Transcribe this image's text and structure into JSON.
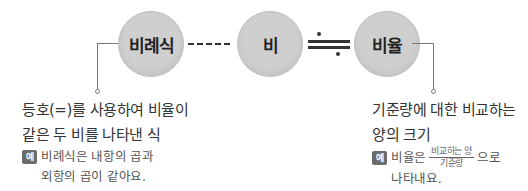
{
  "nodes": [
    {
      "id": "proportion-expression",
      "label": "비례식"
    },
    {
      "id": "ratio",
      "label": "비"
    },
    {
      "id": "rate",
      "label": "비율"
    }
  ],
  "connectors": {
    "ratio_to_expression": "dashed-line",
    "ratio_to_rate": "approximately-equal-sign"
  },
  "left_note": {
    "definition_line1": "등호(=)를 사용하여 비율이",
    "definition_line2": "같은 두 비를 나타낸 식",
    "example_badge": "예",
    "example_line1": "비례식은 내항의 곱과",
    "example_line2": "외항의 곱이 같아요."
  },
  "right_note": {
    "definition_line1": "기준량에 대한 비교하는",
    "definition_line2": "양의 크기",
    "example_badge": "예",
    "example_prefix": "비율은",
    "fraction_numerator": "비교하는 양",
    "fraction_denominator": "기준량",
    "example_suffix": "으로",
    "example_line2": "나타내요."
  },
  "colors": {
    "circle_fill": "#cfcfcf",
    "circle_border": "#bdbdbd",
    "text": "#333333",
    "badge": "#6b6b6b",
    "leader_line": "#777777"
  }
}
